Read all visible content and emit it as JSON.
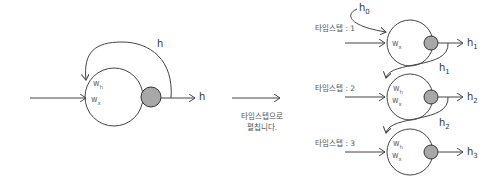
{
  "left_diagram": {
    "weights": [
      "w_h",
      "w_x"
    ],
    "weight_h": "w",
    "weight_h_sub": "h",
    "weight_x": "w",
    "weight_x_sub": "x",
    "loop_label": "h",
    "output_label": "h"
  },
  "transition": {
    "caption_line1": "타임스텝으로",
    "caption_line2": "펼칩니다."
  },
  "right_diagram": {
    "steps": [
      {
        "label": "타임스텝 : 1",
        "input_h": "h",
        "input_h_sub": "0",
        "weight_x": "w",
        "weight_x_sub": "x",
        "output": "h",
        "output_sub": "1"
      },
      {
        "label": "타임스텝 : 2",
        "input_h": "h",
        "input_h_sub": "1",
        "weight_h": "w",
        "weight_h_sub": "h",
        "weight_x": "w",
        "weight_x_sub": "x",
        "output": "h",
        "output_sub": "2"
      },
      {
        "label": "타임스텝 : 3",
        "input_h": "h",
        "input_h_sub": "2",
        "weight_h": "w",
        "weight_h_sub": "h",
        "weight_x": "w",
        "weight_x_sub": "x",
        "output": "h",
        "output_sub": "3"
      }
    ]
  },
  "colors": {
    "line": "#444444",
    "activation_fill": "#a8a8a8"
  }
}
